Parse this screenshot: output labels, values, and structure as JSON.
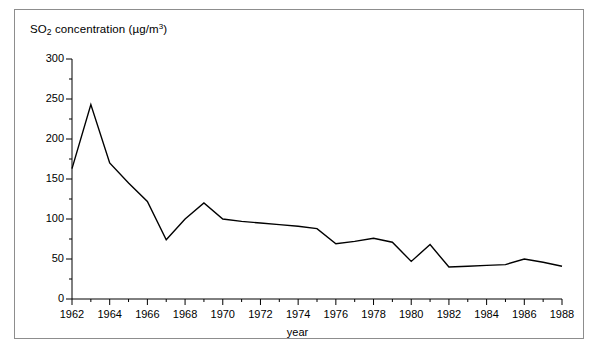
{
  "figure": {
    "caption_partial": ""
  },
  "chart_data": {
    "type": "line",
    "title": "",
    "xlabel": "year",
    "ylabel": "SO2 concentration (µg/m3)",
    "ylabel_parts": {
      "prefix": "SO",
      "sub": "2",
      "middle": " concentration (µg/m",
      "sup": "3",
      "suffix": ")"
    },
    "xlim": [
      1962,
      1988
    ],
    "ylim": [
      0,
      300
    ],
    "ytick_major_step": 50,
    "ytick_minor_step": 25,
    "xtick_major_step": 2,
    "xtick_minor_step": 1,
    "grid": false,
    "legend": null,
    "line_color": "#000000",
    "x": [
      1962,
      1963,
      1964,
      1965,
      1966,
      1967,
      1968,
      1969,
      1970,
      1971,
      1972,
      1973,
      1974,
      1975,
      1976,
      1977,
      1978,
      1979,
      1980,
      1981,
      1982,
      1983,
      1984,
      1985,
      1986,
      1987,
      1988
    ],
    "values": [
      163,
      243,
      170,
      145,
      122,
      74,
      100,
      120,
      100,
      97,
      95,
      93,
      91,
      88,
      69,
      72,
      76,
      71,
      47,
      68,
      40,
      41,
      42,
      43,
      50,
      46,
      41
    ],
    "ytick_labels": [
      "0",
      "50",
      "100",
      "150",
      "200",
      "250",
      "300"
    ],
    "ytick_values": [
      0,
      50,
      100,
      150,
      200,
      250,
      300
    ],
    "xtick_labels": [
      "1962",
      "1964",
      "1966",
      "1968",
      "1970",
      "1972",
      "1974",
      "1976",
      "1978",
      "1980",
      "1982",
      "1984",
      "1986",
      "1988"
    ],
    "xtick_values": [
      1962,
      1964,
      1966,
      1968,
      1970,
      1972,
      1974,
      1976,
      1978,
      1980,
      1982,
      1984,
      1986,
      1988
    ]
  }
}
